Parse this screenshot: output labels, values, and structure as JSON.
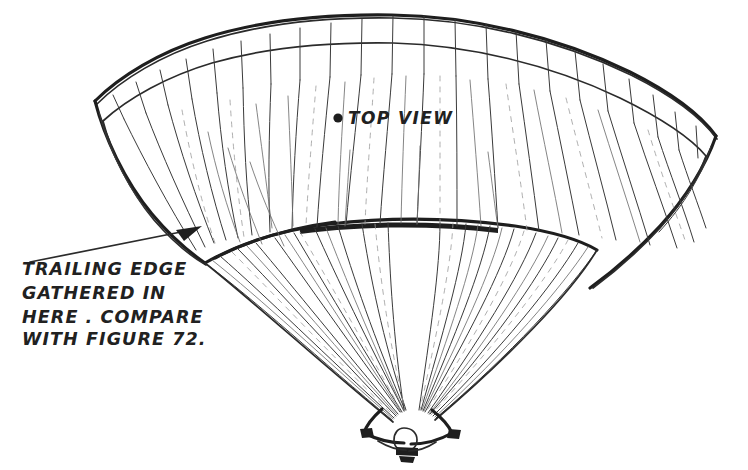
{
  "figure": {
    "background_color": "#ffffff",
    "ink_color": "#2b2b2b",
    "ink_dark_color": "#1e1e1e",
    "ink_light_color": "#9a9a9a"
  },
  "labels": {
    "top_view": {
      "bullet": "●",
      "text": "TOP VIEW",
      "x": 348,
      "y": 124
    }
  },
  "annotation": {
    "name": "trailing-edge-note",
    "lines": [
      "TRAILING EDGE",
      "GATHERED IN",
      "HERE . COMPARE",
      "WITH FIGURE 72."
    ],
    "x": 22,
    "line_baselines": [
      275,
      299,
      323,
      345
    ],
    "leader": {
      "from_x": 30,
      "from_y": 262,
      "to_x": 202,
      "to_y": 226
    }
  },
  "canopy": {
    "gore_seam_count": 26,
    "has_outer_hem_band": true,
    "has_skirt_line": true,
    "left_tip": {
      "x": 95,
      "y": 101
    },
    "right_tip": {
      "x": 716,
      "y": 136
    },
    "apex": {
      "x": 420,
      "y": 17
    }
  },
  "harness": {
    "name": "confluence-link",
    "x": 408,
    "y": 430,
    "description": "suspension lines converge into riser link hardware"
  }
}
